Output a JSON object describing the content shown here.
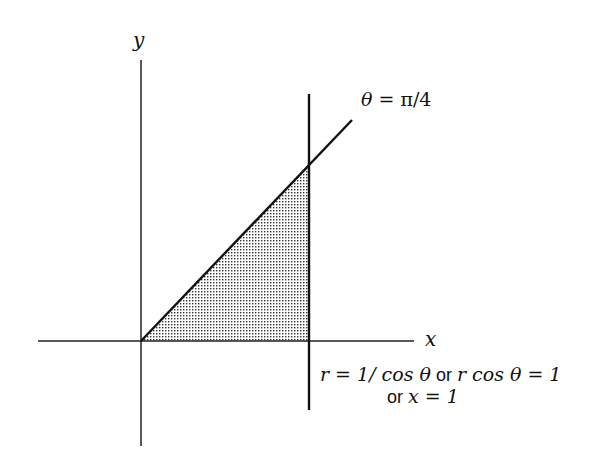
{
  "diagram": {
    "axes": {
      "x_label": "x",
      "y_label": "y"
    },
    "ray_label": {
      "theta": "θ",
      "rest": " = π/4"
    },
    "line_label": {
      "line1_a": "r = 1/ cos θ",
      "or1": " or ",
      "line1_b": "r cos θ = 1",
      "or2": "or ",
      "line2": "x = 1"
    },
    "colors": {
      "stroke": "#111111",
      "fill_dots": "#333333"
    }
  }
}
